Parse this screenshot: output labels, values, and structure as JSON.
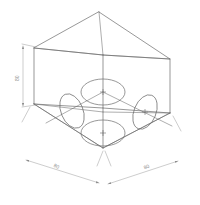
{
  "drawing": {
    "title": "Isometric cube with four circular features",
    "background_color": "#ffffff",
    "line_color": "#6b6b6b",
    "dim_line_color": "#9a9a9a",
    "text_color": "#8d8d8d",
    "projection": "isometric"
  },
  "dimensions": {
    "height_label": "80",
    "width_label": "80",
    "depth_label": "80",
    "height_name": "height-dimension",
    "width_name": "width-dimension",
    "depth_name": "depth-dimension"
  },
  "features": [
    {
      "name": "top-circle",
      "cx": 103,
      "cy": 92,
      "rx": 22,
      "ry": 13,
      "rot": 0,
      "center_mark": true
    },
    {
      "name": "bottom-circle",
      "cx": 103,
      "cy": 133,
      "rx": 22,
      "ry": 13,
      "rot": 0,
      "center_mark": true
    },
    {
      "name": "left-circle",
      "cx": 72,
      "cy": 111,
      "rx": 11,
      "ry": 18,
      "rot": -22,
      "center_mark": false
    },
    {
      "name": "right-circle",
      "cx": 145,
      "cy": 112,
      "rx": 11,
      "ry": 18,
      "rot": 22,
      "center_mark": true
    }
  ],
  "vertices": {
    "top_apex": [
      99,
      12
    ],
    "top_left": [
      34,
      48
    ],
    "top_right": [
      170,
      59
    ],
    "top_front": [
      103,
      55
    ],
    "bot_left": [
      34,
      104
    ],
    "bot_right": [
      170,
      113
    ],
    "bot_front": [
      103,
      148
    ]
  }
}
